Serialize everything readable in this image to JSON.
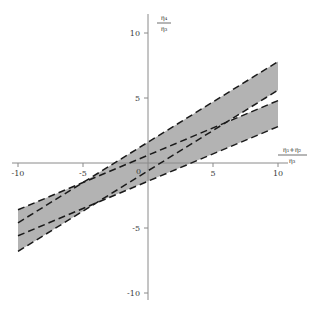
{
  "figure": {
    "background_color": "#ffffff",
    "axis_color": "#8a8a8a",
    "band_fill_color": "#b3b3b3",
    "band_edge_color": "#1a1a1a",
    "gap_fill_color": "#f2f2ef"
  },
  "axes": {
    "x_label": {
      "numerator": "η₁+η₂",
      "denominator": "η₃",
      "text": "(η₁+η₂)/η₃"
    },
    "y_label": {
      "numerator": "η₄",
      "denominator": "η₃",
      "text": "η₄/η₃"
    },
    "x_ticks": [
      {
        "value": -10,
        "label": "-10"
      },
      {
        "value": -5,
        "label": "-5"
      },
      {
        "value": 5,
        "label": "5"
      },
      {
        "value": 10,
        "label": "10"
      }
    ],
    "y_ticks": [
      {
        "value": 10,
        "label": "10"
      },
      {
        "value": 5,
        "label": "5"
      },
      {
        "value": -5,
        "label": "-5"
      },
      {
        "value": -10,
        "label": "-10"
      }
    ],
    "origin_label": "0",
    "xlim": [
      -10,
      10
    ],
    "ylim": [
      -10,
      10
    ]
  },
  "chart_data": {
    "type": "area",
    "title": "",
    "subtitle": "",
    "xlabel": "(η₁+η₂)/η₃",
    "ylabel": "η₄/η₃",
    "xlim": [
      -10,
      10
    ],
    "ylim": [
      -10,
      10
    ],
    "grid": false,
    "legend": "none",
    "annotations": [],
    "boundary_lines": [
      {
        "name": "upper-band-top",
        "slope": 0.62,
        "intercept": 1.6,
        "style": "dashed",
        "x_range": [
          -10,
          10
        ],
        "y_at_xmin": -4.6,
        "y_at_xmax": 7.8
      },
      {
        "name": "upper-band-bottom",
        "slope": 0.62,
        "intercept": -0.6,
        "style": "dashed",
        "x_range": [
          -10,
          10
        ],
        "y_at_xmin": -6.8,
        "y_at_xmax": 5.6
      },
      {
        "name": "lower-band-top",
        "slope": 0.42,
        "intercept": 0.6,
        "style": "dashed",
        "x_range": [
          -10,
          10
        ],
        "y_at_xmin": -3.6,
        "y_at_xmax": 4.8
      },
      {
        "name": "lower-band-bottom",
        "slope": 0.42,
        "intercept": -1.4,
        "style": "dashed",
        "x_range": [
          -10,
          10
        ],
        "y_at_xmin": -5.6,
        "y_at_xmax": 2.8
      }
    ],
    "shaded_regions": [
      {
        "name": "steep-band",
        "fill": "#b3b3b3",
        "vertices": [
          [
            -10,
            -4.6
          ],
          [
            10,
            7.8
          ],
          [
            10,
            5.6
          ],
          [
            -10,
            -6.8
          ]
        ]
      },
      {
        "name": "shallow-band",
        "fill": "#b3b3b3",
        "vertices": [
          [
            -10,
            -3.6
          ],
          [
            10,
            4.8
          ],
          [
            10,
            2.8
          ],
          [
            -10,
            -5.6
          ]
        ]
      }
    ],
    "series": [
      {
        "name": "steep-band-upper-edge",
        "x": [
          -10,
          10
        ],
        "values": [
          -4.6,
          7.8
        ]
      },
      {
        "name": "steep-band-lower-edge",
        "x": [
          -10,
          10
        ],
        "values": [
          -6.8,
          5.6
        ]
      },
      {
        "name": "shallow-band-upper-edge",
        "x": [
          -10,
          10
        ],
        "values": [
          -3.6,
          4.8
        ]
      },
      {
        "name": "shallow-band-lower-edge",
        "x": [
          -10,
          10
        ],
        "values": [
          -5.6,
          2.8
        ]
      }
    ]
  }
}
